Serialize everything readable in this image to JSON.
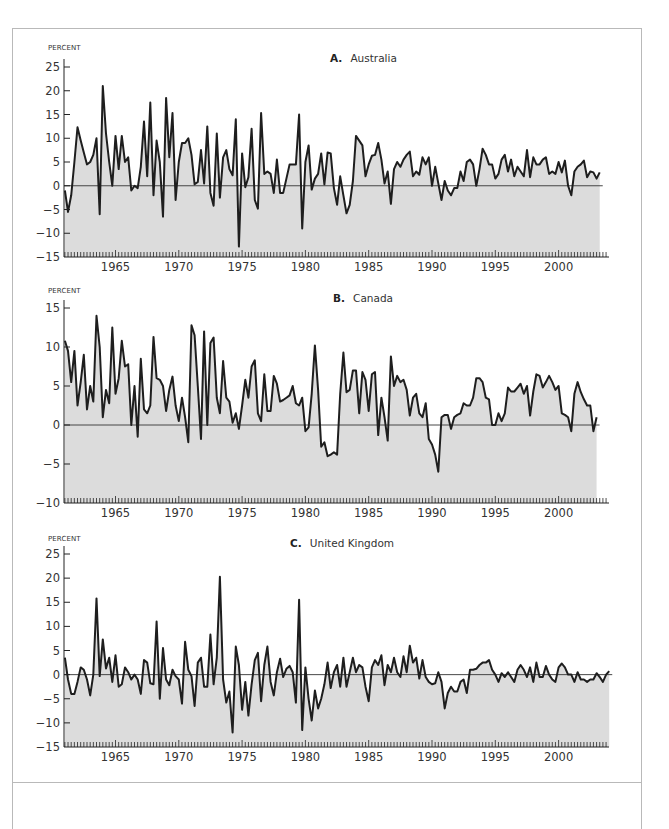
{
  "figure": {
    "y_axis_unit": "PERCENT",
    "panels": [
      {
        "letter": "A.",
        "name": "Australia"
      },
      {
        "letter": "B.",
        "name": "Canada"
      },
      {
        "letter": "C.",
        "name": "United Kingdom"
      }
    ]
  },
  "chart_data": [
    {
      "type": "area",
      "title": "A. Australia",
      "xlabel": "",
      "ylabel": "PERCENT",
      "ylim": [
        -15,
        25
      ],
      "yticks": [
        25,
        20,
        15,
        10,
        5,
        0,
        -5,
        -10,
        -15
      ],
      "xticks": [
        1965,
        1970,
        1975,
        1980,
        1985,
        1990,
        1995,
        2000
      ],
      "x_start": 1961.0,
      "x_step": 0.25,
      "grid": false,
      "baseline": 0,
      "values": [
        -1,
        -5.5,
        -2,
        5,
        12.3,
        9.5,
        7,
        4.5,
        5,
        6.5,
        10,
        -6,
        21,
        11,
        5,
        0,
        10.5,
        3.5,
        10.5,
        5,
        6,
        -1,
        0,
        -0.5,
        4,
        13.5,
        2,
        17.5,
        -2,
        9.5,
        5,
        -6.5,
        18.5,
        6,
        15.3,
        -3,
        5,
        9,
        9,
        10,
        6.5,
        0.3,
        0.8,
        7.5,
        0.5,
        12.5,
        -1.5,
        -4.2,
        11,
        -2.5,
        6,
        7.5,
        3.5,
        2.2,
        14,
        -12.8,
        6.8,
        -0.3,
        1.8,
        12,
        -3,
        -4.8,
        15.3,
        2.5,
        3,
        2.5,
        -1.5,
        5.5,
        -1.5,
        -1.5,
        1.5,
        4.5,
        4.5,
        4.5,
        15,
        -9,
        5,
        8.5,
        -0.8,
        1.5,
        2.5,
        6.8,
        0.3,
        7,
        6.8,
        -0.5,
        -4,
        2,
        -2,
        -5.8,
        -4,
        1,
        10.5,
        9.5,
        8.5,
        2,
        4.5,
        6.3,
        6.5,
        9,
        5.5,
        0.5,
        3,
        -3.8,
        3.5,
        5,
        4,
        5.5,
        6.5,
        7.2,
        2,
        3,
        2.3,
        6,
        4.5,
        6,
        0,
        4,
        0.5,
        -3,
        1,
        -1,
        -2,
        -0.5,
        -0.5,
        3,
        1,
        5,
        5.5,
        4.5,
        0,
        3.5,
        7.8,
        6.5,
        4.5,
        4.5,
        1.5,
        2.5,
        5.5,
        6.5,
        3,
        5.5,
        2,
        4,
        3,
        2,
        7.5,
        1.8,
        6,
        4.5,
        4.5,
        5.5,
        6,
        2.5,
        3,
        2.5,
        5,
        2.8,
        5.3,
        0,
        -2,
        3,
        4,
        4.5,
        5.3,
        1.8,
        3,
        2.8,
        1.5,
        2.8
      ]
    },
    {
      "type": "area",
      "title": "B. Canada",
      "xlabel": "",
      "ylabel": "PERCENT",
      "ylim": [
        -10,
        15
      ],
      "yticks": [
        15,
        10,
        5,
        0,
        -5,
        -10
      ],
      "xticks": [
        1965,
        1970,
        1975,
        1980,
        1985,
        1990,
        1995,
        2000
      ],
      "x_start": 1961.0,
      "x_step": 0.25,
      "grid": false,
      "baseline": 0,
      "values": [
        10.8,
        9.5,
        5.5,
        9.5,
        2.5,
        5.5,
        9,
        2,
        5,
        3,
        14,
        10,
        1,
        4.5,
        2.8,
        12.5,
        4,
        6,
        10.8,
        7.5,
        7.8,
        0,
        5,
        -1.5,
        8.5,
        2,
        1.5,
        2.5,
        11.3,
        6,
        5.8,
        5,
        1.8,
        4.5,
        6.2,
        2.5,
        0.5,
        3.5,
        1,
        -2.2,
        12.8,
        11.5,
        5,
        -1.8,
        12,
        0,
        10.5,
        11.2,
        3.5,
        1.5,
        8.2,
        3.5,
        3,
        0.3,
        1.5,
        -0.5,
        2.5,
        5.8,
        3.5,
        7.5,
        8.3,
        1.5,
        0.5,
        6.5,
        1.8,
        1.8,
        6.3,
        5.3,
        3,
        3.2,
        3.5,
        3.8,
        5,
        2.8,
        2.5,
        3.5,
        -0.8,
        -0.3,
        4,
        10.2,
        4.5,
        -2.8,
        -2.2,
        -4,
        -3.8,
        -3.5,
        -3.8,
        4,
        9.3,
        4.2,
        4.5,
        7,
        7,
        1.5,
        6.8,
        5.8,
        1.8,
        6.5,
        6.8,
        -1.3,
        3.5,
        1,
        -2,
        8.8,
        5,
        6.3,
        5.5,
        5.8,
        4.5,
        1.2,
        3.5,
        4,
        1.5,
        1,
        2.8,
        -1.8,
        -2.5,
        -3.8,
        -6,
        1,
        1.3,
        1.3,
        -0.5,
        1,
        1.3,
        1.5,
        2.8,
        2.5,
        2.5,
        3.5,
        6,
        6,
        5.5,
        3.5,
        3.3,
        0,
        0,
        1.5,
        0.5,
        1.5,
        4.8,
        4.3,
        4.3,
        4.8,
        5.3,
        4,
        5,
        1.2,
        4.3,
        6.5,
        6.3,
        4.8,
        5.5,
        6.3,
        5.5,
        4.5,
        5,
        1.5,
        1.3,
        1,
        -0.8,
        4,
        5.5,
        4.2,
        3.3,
        2.5,
        2.5,
        -0.8,
        1
      ]
    },
    {
      "type": "area",
      "title": "C. United Kingdom",
      "xlabel": "",
      "ylabel": "PERCENT",
      "ylim": [
        -15,
        25
      ],
      "yticks": [
        25,
        20,
        15,
        10,
        5,
        0,
        -5,
        -10,
        -15
      ],
      "xticks": [
        1965,
        1970,
        1975,
        1980,
        1985,
        1990,
        1995,
        2000
      ],
      "x_start": 1961.0,
      "x_step": 0.25,
      "grid": false,
      "baseline": 0,
      "values": [
        3.5,
        -1,
        -4,
        -4,
        -1.5,
        1.5,
        1,
        -1,
        -4.3,
        0,
        15.8,
        -0.3,
        7.3,
        1.3,
        3.5,
        -1.5,
        4,
        -2.5,
        -2,
        1.5,
        0.5,
        -1,
        0,
        -1,
        -4,
        3,
        2.5,
        -1.8,
        -2,
        11,
        -5,
        5.5,
        -1,
        -2.2,
        1,
        -0.3,
        -1,
        -6,
        6.8,
        1,
        -0.3,
        -6.5,
        2.5,
        3.5,
        -2.5,
        -2.5,
        8.3,
        -2,
        3.5,
        20.3,
        -1,
        -5.8,
        -3.5,
        -12,
        5.8,
        2,
        -7.3,
        -1.5,
        -8.5,
        -2,
        3,
        4.5,
        -5.5,
        2,
        5.8,
        -1.5,
        -4.3,
        0.5,
        3.3,
        -0.5,
        1.2,
        1.8,
        0.5,
        -5.8,
        15.5,
        -11.5,
        1.5,
        -5,
        -9.5,
        -3.3,
        -7,
        -5,
        -2,
        2.5,
        -2.8,
        0.5,
        2,
        -2.5,
        3.5,
        -2.5,
        0.5,
        3.5,
        0.5,
        2,
        1.5,
        -2.5,
        -5.5,
        1.5,
        3,
        2,
        4,
        -2.2,
        2,
        0.5,
        3.5,
        0.5,
        -0.5,
        3.8,
        0.5,
        6,
        2.5,
        3.5,
        -0.8,
        3,
        -0.5,
        -1.5,
        -2,
        -1.8,
        0.5,
        -1.5,
        -7,
        -3.8,
        -2.5,
        -3.5,
        -3.5,
        -1.5,
        -1,
        -3.8,
        1,
        1,
        1.2,
        2,
        2.5,
        2.5,
        3,
        1,
        0,
        -1.5,
        0.3,
        -0.5,
        0.5,
        -0.5,
        -1.5,
        1,
        2,
        1,
        -0.5,
        1.5,
        -1.5,
        2.5,
        -0.5,
        -0.5,
        1.8,
        0,
        -1,
        -1.5,
        1.5,
        2.3,
        1.5,
        0,
        0,
        -1.5,
        0.5,
        -1,
        -1,
        -1.5,
        -1,
        -1,
        0.3,
        -0.5,
        -1.5,
        0,
        0.7
      ],
      "notes": "Values are approximate readings of quarterly percent changes, estimated from the plotted trace."
    }
  ]
}
